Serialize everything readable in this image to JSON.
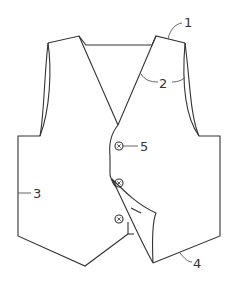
{
  "diagram": {
    "type": "patent-figure",
    "labels": [
      {
        "id": "1",
        "text": "1"
      },
      {
        "id": "2",
        "text": "2"
      },
      {
        "id": "3",
        "text": "3"
      },
      {
        "id": "4",
        "text": "4"
      },
      {
        "id": "5",
        "text": "5"
      }
    ],
    "buttons": 3,
    "colors": {
      "line": "#333333",
      "background": "#ffffff"
    }
  }
}
